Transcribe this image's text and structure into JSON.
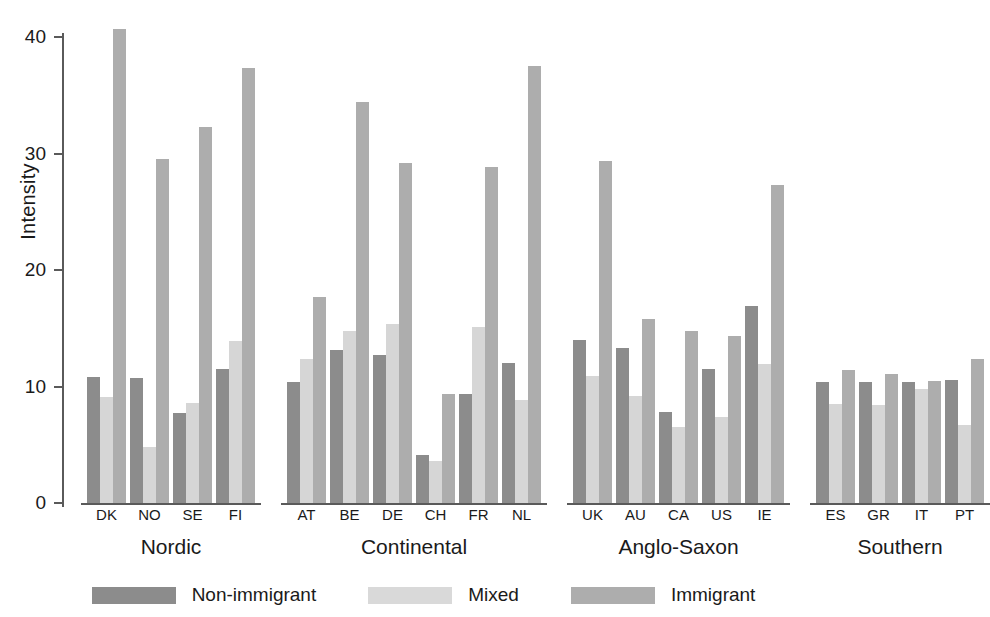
{
  "chart_data": {
    "type": "bar",
    "title": "",
    "xlabel": "",
    "ylabel": "Intensity",
    "ylim": [
      0,
      42
    ],
    "yticks": [
      0,
      10,
      20,
      30,
      40
    ],
    "ytick_labels": [
      "0",
      "10",
      "20",
      "30",
      "40"
    ],
    "grid": false,
    "legend_position": "bottom",
    "categories": [
      "DK",
      "NO",
      "SE",
      "FI",
      "AT",
      "BE",
      "DE",
      "CH",
      "FR",
      "NL",
      "UK",
      "AU",
      "CA",
      "US",
      "IE",
      "ES",
      "GR",
      "IT",
      "PT"
    ],
    "groups": [
      {
        "label": "Nordic",
        "categories": [
          "DK",
          "NO",
          "SE",
          "FI"
        ]
      },
      {
        "label": "Continental",
        "categories": [
          "AT",
          "BE",
          "DE",
          "CH",
          "FR",
          "NL"
        ]
      },
      {
        "label": "Anglo-Saxon",
        "categories": [
          "UK",
          "AU",
          "CA",
          "US",
          "IE"
        ]
      },
      {
        "label": "Southern",
        "categories": [
          "ES",
          "GR",
          "IT",
          "PT"
        ]
      }
    ],
    "series": [
      {
        "name": "Non-immigrant",
        "color": "#8c8c8c",
        "values": [
          10.8,
          10.7,
          7.7,
          11.5,
          10.4,
          13.1,
          12.7,
          4.1,
          9.4,
          12.0,
          14.0,
          13.3,
          7.8,
          11.5,
          16.9,
          10.4,
          10.4,
          10.4,
          10.6
        ]
      },
      {
        "name": "Mixed",
        "color": "#d6d6d6",
        "values": [
          9.1,
          4.8,
          8.6,
          13.9,
          12.4,
          14.8,
          15.4,
          3.6,
          15.1,
          8.8,
          10.9,
          9.2,
          6.5,
          7.4,
          11.9,
          8.5,
          8.4,
          9.8,
          6.7
        ]
      },
      {
        "name": "Immigrant",
        "color": "#adadad",
        "values": [
          40.7,
          29.5,
          32.3,
          37.3,
          17.7,
          34.4,
          29.2,
          9.4,
          28.8,
          37.5,
          29.4,
          15.8,
          14.8,
          14.3,
          27.3,
          11.4,
          11.1,
          10.5,
          12.4
        ]
      }
    ]
  },
  "legend": {
    "items": [
      {
        "label": "Non-immigrant",
        "swatch": "s0"
      },
      {
        "label": "Mixed",
        "swatch": "s1"
      },
      {
        "label": "Immigrant",
        "swatch": "s2"
      }
    ]
  }
}
